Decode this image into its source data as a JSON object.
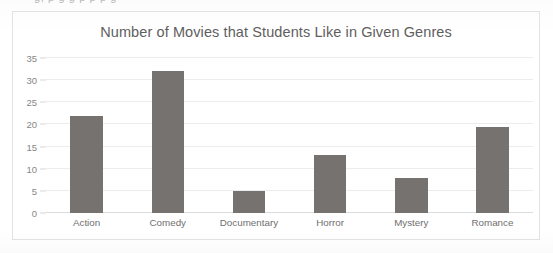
{
  "chart_data": {
    "type": "bar",
    "title": "Number of Movies that Students Like in Given Genres",
    "xlabel": "",
    "ylabel": "",
    "categories": [
      "Action",
      "Comedy",
      "Documentary",
      "Horror",
      "Mystery",
      "Romance"
    ],
    "values": [
      22,
      32,
      5,
      13,
      8,
      19.5
    ],
    "ylim": [
      0,
      35
    ],
    "ytick_values": [
      0,
      5,
      10,
      15,
      20,
      25,
      30,
      35
    ],
    "ytick_labels": [
      "0",
      "5",
      "10",
      "15",
      "20",
      "25",
      "30",
      "35"
    ],
    "grid": true,
    "legend": false,
    "legend_position": "none",
    "series": [
      {
        "name": "Number of Movies",
        "values": [
          22,
          32,
          5,
          13,
          8,
          19.5
        ]
      }
    ],
    "colors": {
      "bar": "#767270",
      "gridline": "#ececec",
      "axis_line": "#dcdcdc",
      "title_text": "#5e5e5e",
      "tick_text": "#868686",
      "category_text": "#6f6f6f",
      "frame_border": "#e3e3e3",
      "background": "#ffffff"
    }
  },
  "artifacts": {
    "cutoff_text": "g, p g g p   p p g"
  }
}
